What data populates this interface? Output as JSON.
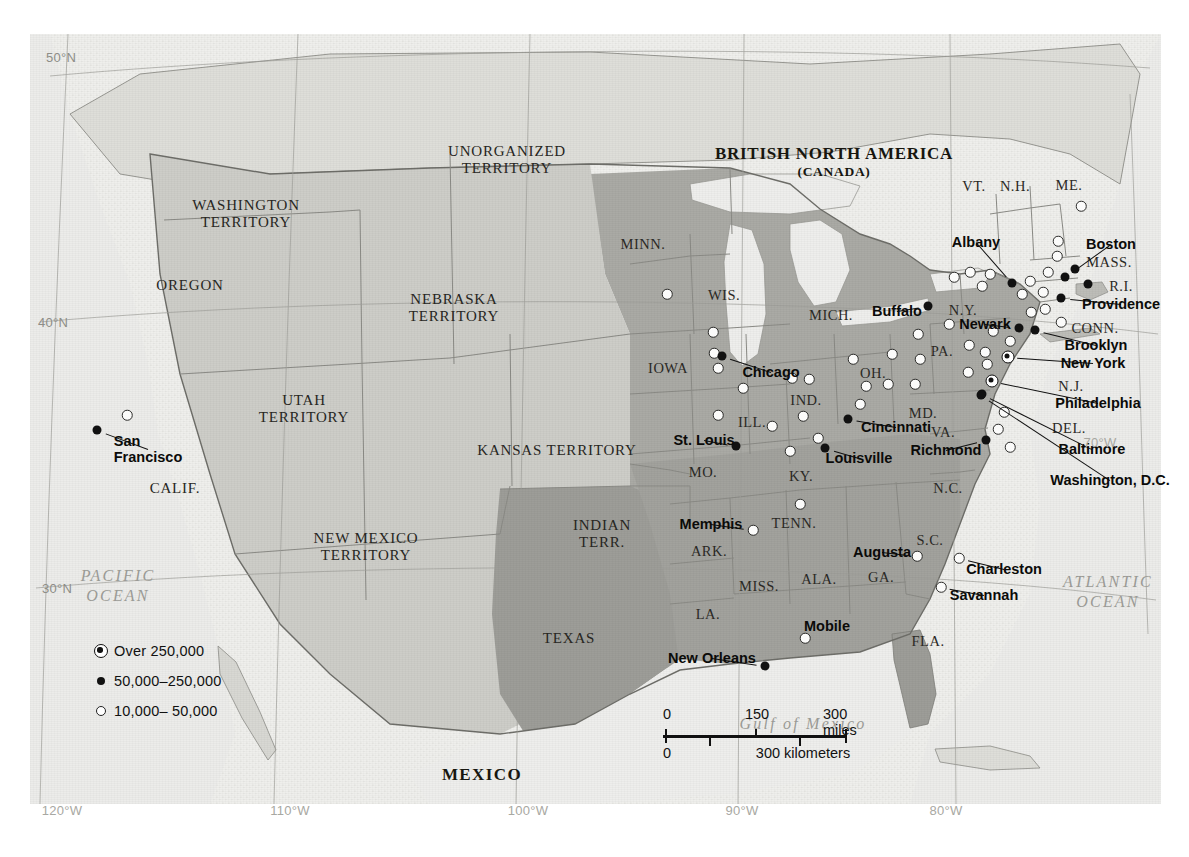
{
  "map": {
    "title": "United States in 1860 — Population Centers",
    "projection_note": "conic",
    "colors": {
      "union_fill": "#a9a9a4",
      "territory_fill": "#cbcbc6",
      "texas_fill": "#9b9b96",
      "water": "#e9e9e6",
      "plate_bg": "#efefec",
      "border": "#7d7d78",
      "ink": "#111111"
    }
  },
  "countries": [
    {
      "name": "BRITISH NORTH AMERICA",
      "sub": "(CANADA)",
      "x": 804,
      "y": 128
    },
    {
      "name": "MEXICO",
      "x": 452,
      "y": 741
    }
  ],
  "oceans": [
    {
      "name": "PACIFIC\nOCEAN",
      "line1": "PACIFIC",
      "line2": "OCEAN",
      "x": 88,
      "y": 552
    },
    {
      "name": "ATLANTIC\nOCEAN",
      "line1": "ATLANTIC",
      "line2": "OCEAN",
      "x": 1078,
      "y": 558
    },
    {
      "name": "Gulf of Mexico",
      "line1": "Gulf of Mexico",
      "line2": "",
      "x": 773,
      "y": 690
    }
  ],
  "territories": [
    {
      "label": "WASHINGTON\nTERRITORY",
      "l1": "WASHINGTON",
      "l2": "TERRITORY",
      "x": 216,
      "y": 180
    },
    {
      "label": "OREGON",
      "l1": "OREGON",
      "l2": "",
      "x": 160,
      "y": 252
    },
    {
      "label": "NEBRASKA\nTERRITORY",
      "l1": "NEBRASKA",
      "l2": "TERRITORY",
      "x": 424,
      "y": 274
    },
    {
      "label": "UTAH\nTERRITORY",
      "l1": "UTAH",
      "l2": "TERRITORY",
      "x": 274,
      "y": 375
    },
    {
      "label": "KANSAS TERRITORY",
      "l1": "KANSAS TERRITORY",
      "l2": "",
      "x": 527,
      "y": 417
    },
    {
      "label": "NEW MEXICO\nTERRITORY",
      "l1": "NEW MEXICO",
      "l2": "TERRITORY",
      "x": 336,
      "y": 513
    },
    {
      "label": "INDIAN\nTERR.",
      "l1": "INDIAN",
      "l2": "TERR.",
      "x": 572,
      "y": 500
    },
    {
      "label": "TEXAS",
      "l1": "TEXAS",
      "l2": "",
      "x": 539,
      "y": 605
    },
    {
      "label": "UNORGANIZED\nTERRITORY",
      "l1": "UNORGANIZED",
      "l2": "TERRITORY",
      "x": 477,
      "y": 126
    },
    {
      "label": "CALIF.",
      "l1": "CALIF.",
      "l2": "",
      "x": 145,
      "y": 455
    }
  ],
  "state_abbrs": [
    {
      "t": "MINN.",
      "x": 613,
      "y": 210
    },
    {
      "t": "WIS.",
      "x": 694,
      "y": 261
    },
    {
      "t": "MICH.",
      "x": 801,
      "y": 281
    },
    {
      "t": "IOWA",
      "x": 638,
      "y": 334
    },
    {
      "t": "ILL.",
      "x": 722,
      "y": 388
    },
    {
      "t": "IND.",
      "x": 776,
      "y": 366
    },
    {
      "t": "OH.",
      "x": 843,
      "y": 339
    },
    {
      "t": "MO.",
      "x": 673,
      "y": 438
    },
    {
      "t": "KY.",
      "x": 771,
      "y": 442
    },
    {
      "t": "TENN.",
      "x": 764,
      "y": 489
    },
    {
      "t": "ARK.",
      "x": 679,
      "y": 517
    },
    {
      "t": "MISS.",
      "x": 729,
      "y": 552
    },
    {
      "t": "ALA.",
      "x": 789,
      "y": 545
    },
    {
      "t": "GA.",
      "x": 851,
      "y": 543
    },
    {
      "t": "LA.",
      "x": 678,
      "y": 580
    },
    {
      "t": "FLA.",
      "x": 898,
      "y": 607
    },
    {
      "t": "S.C.",
      "x": 900,
      "y": 506
    },
    {
      "t": "N.C.",
      "x": 918,
      "y": 454
    },
    {
      "t": "VA.",
      "x": 913,
      "y": 398
    },
    {
      "t": "MD.",
      "x": 893,
      "y": 379
    },
    {
      "t": "PA.",
      "x": 912,
      "y": 317
    },
    {
      "t": "N.Y.",
      "x": 933,
      "y": 276
    },
    {
      "t": "N.J.",
      "x": 1041,
      "y": 352
    },
    {
      "t": "DEL.",
      "x": 1039,
      "y": 394
    },
    {
      "t": "CONN.",
      "x": 1065,
      "y": 294
    },
    {
      "t": "R.I.",
      "x": 1091,
      "y": 252
    },
    {
      "t": "MASS.",
      "x": 1079,
      "y": 228
    },
    {
      "t": "VT.",
      "x": 944,
      "y": 152
    },
    {
      "t": "N.H.",
      "x": 985,
      "y": 152
    },
    {
      "t": "ME.",
      "x": 1039,
      "y": 151
    }
  ],
  "cities": [
    {
      "name": "San Francisco",
      "l1": "San",
      "l2": "Francisco",
      "tier": "mid",
      "label_x": 118,
      "label_y": 415,
      "dot_x": 67,
      "dot_y": 396
    },
    {
      "name": "Chicago",
      "l1": "Chicago",
      "l2": "",
      "tier": "mid",
      "label_x": 741,
      "label_y": 338,
      "dot_x": 692,
      "dot_y": 322
    },
    {
      "name": "St. Louis",
      "l1": "St. Louis",
      "l2": "",
      "tier": "mid",
      "label_x": 674,
      "label_y": 406,
      "dot_x": 706,
      "dot_y": 412
    },
    {
      "name": "Cincinnati",
      "l1": "Cincinnati",
      "l2": "",
      "tier": "mid",
      "label_x": 866,
      "label_y": 393,
      "dot_x": 818,
      "dot_y": 385
    },
    {
      "name": "Louisville",
      "l1": "Louisville",
      "l2": "",
      "tier": "mid",
      "label_x": 829,
      "label_y": 424,
      "dot_x": 795,
      "dot_y": 414
    },
    {
      "name": "Buffalo",
      "l1": "Buffalo",
      "l2": "",
      "tier": "mid",
      "label_x": 867,
      "label_y": 277,
      "dot_x": 898,
      "dot_y": 272
    },
    {
      "name": "Albany",
      "l1": "Albany",
      "l2": "",
      "tier": "mid",
      "label_x": 946,
      "label_y": 208,
      "dot_x": 982,
      "dot_y": 249
    },
    {
      "name": "Boston",
      "l1": "Boston",
      "l2": "",
      "tier": "mid",
      "label_x": 1081,
      "label_y": 210,
      "dot_x": 1035,
      "dot_y": 243
    },
    {
      "name": "Providence",
      "l1": "Providence",
      "l2": "",
      "tier": "mid",
      "label_x": 1091,
      "label_y": 270,
      "dot_x": 1031,
      "dot_y": 264
    },
    {
      "name": "Newark",
      "l1": "Newark",
      "l2": "",
      "tier": "mid",
      "label_x": 955,
      "label_y": 290,
      "dot_x": 989,
      "dot_y": 294
    },
    {
      "name": "Brooklyn",
      "l1": "Brooklyn",
      "l2": "",
      "tier": "mid",
      "label_x": 1066,
      "label_y": 311,
      "dot_x": 1005,
      "dot_y": 296
    },
    {
      "name": "New York",
      "l1": "New York",
      "l2": "",
      "tier": "over",
      "label_x": 1063,
      "label_y": 329,
      "dot_x": 978,
      "dot_y": 323
    },
    {
      "name": "Philadelphia",
      "l1": "Philadelphia",
      "l2": "",
      "tier": "over",
      "label_x": 1068,
      "label_y": 369,
      "dot_x": 962,
      "dot_y": 347
    },
    {
      "name": "Baltimore",
      "l1": "Baltimore",
      "l2": "",
      "tier": "mid",
      "label_x": 1062,
      "label_y": 415,
      "dot_x": 952,
      "dot_y": 360
    },
    {
      "name": "Washington, D.C.",
      "l1": "Washington, D.C.",
      "l2": "",
      "tier": "mid",
      "label_x": 1080,
      "label_y": 446,
      "dot_x": 951,
      "dot_y": 361
    },
    {
      "name": "Richmond",
      "l1": "Richmond",
      "l2": "",
      "tier": "mid",
      "label_x": 916,
      "label_y": 416,
      "dot_x": 956,
      "dot_y": 406
    },
    {
      "name": "Memphis",
      "l1": "Memphis",
      "l2": "",
      "tier": "small",
      "label_x": 681,
      "label_y": 490,
      "dot_x": 723,
      "dot_y": 496
    },
    {
      "name": "Augusta",
      "l1": "Augusta",
      "l2": "",
      "tier": "small",
      "label_x": 852,
      "label_y": 518,
      "dot_x": 887,
      "dot_y": 522
    },
    {
      "name": "Charleston",
      "l1": "Charleston",
      "l2": "",
      "tier": "small",
      "label_x": 974,
      "label_y": 535,
      "dot_x": 929,
      "dot_y": 524
    },
    {
      "name": "Savannah",
      "l1": "Savannah",
      "l2": "",
      "tier": "small",
      "label_x": 954,
      "label_y": 561,
      "dot_x": 911,
      "dot_y": 553
    },
    {
      "name": "Mobile",
      "l1": "Mobile",
      "l2": "",
      "tier": "small",
      "label_x": 797,
      "label_y": 592,
      "dot_x": 775,
      "dot_y": 604
    },
    {
      "name": "New Orleans",
      "l1": "New Orleans",
      "l2": "",
      "tier": "mid",
      "label_x": 682,
      "label_y": 624,
      "dot_x": 735,
      "dot_y": 632
    }
  ],
  "unlabeled_dots": [
    {
      "tier": "small",
      "x": 97,
      "y": 381
    },
    {
      "tier": "small",
      "x": 637,
      "y": 260
    },
    {
      "tier": "small",
      "x": 683,
      "y": 298
    },
    {
      "tier": "small",
      "x": 684,
      "y": 319
    },
    {
      "tier": "small",
      "x": 688,
      "y": 334
    },
    {
      "tier": "small",
      "x": 713,
      "y": 354
    },
    {
      "tier": "small",
      "x": 688,
      "y": 381
    },
    {
      "tier": "small",
      "x": 742,
      "y": 392
    },
    {
      "tier": "small",
      "x": 762,
      "y": 344
    },
    {
      "tier": "small",
      "x": 779,
      "y": 345
    },
    {
      "tier": "small",
      "x": 773,
      "y": 382
    },
    {
      "tier": "small",
      "x": 788,
      "y": 404
    },
    {
      "tier": "small",
      "x": 760,
      "y": 417
    },
    {
      "tier": "small",
      "x": 770,
      "y": 470
    },
    {
      "tier": "small",
      "x": 823,
      "y": 325
    },
    {
      "tier": "small",
      "x": 836,
      "y": 352
    },
    {
      "tier": "small",
      "x": 830,
      "y": 370
    },
    {
      "tier": "small",
      "x": 858,
      "y": 350
    },
    {
      "tier": "small",
      "x": 862,
      "y": 320
    },
    {
      "tier": "small",
      "x": 885,
      "y": 350
    },
    {
      "tier": "small",
      "x": 890,
      "y": 325
    },
    {
      "tier": "small",
      "x": 888,
      "y": 300
    },
    {
      "tier": "small",
      "x": 919,
      "y": 290
    },
    {
      "tier": "small",
      "x": 924,
      "y": 243
    },
    {
      "tier": "small",
      "x": 940,
      "y": 238
    },
    {
      "tier": "small",
      "x": 952,
      "y": 252
    },
    {
      "tier": "small",
      "x": 939,
      "y": 311
    },
    {
      "tier": "small",
      "x": 955,
      "y": 318
    },
    {
      "tier": "small",
      "x": 957,
      "y": 330
    },
    {
      "tier": "small",
      "x": 938,
      "y": 338
    },
    {
      "tier": "small",
      "x": 963,
      "y": 297
    },
    {
      "tier": "small",
      "x": 980,
      "y": 307
    },
    {
      "tier": "small",
      "x": 992,
      "y": 260
    },
    {
      "tier": "small",
      "x": 1000,
      "y": 247
    },
    {
      "tier": "small",
      "x": 1018,
      "y": 238
    },
    {
      "tier": "small",
      "x": 1013,
      "y": 258
    },
    {
      "tier": "small",
      "x": 1027,
      "y": 222
    },
    {
      "tier": "small",
      "x": 1015,
      "y": 275
    },
    {
      "tier": "small",
      "x": 1031,
      "y": 288
    },
    {
      "tier": "small",
      "x": 1001,
      "y": 278
    },
    {
      "tier": "small",
      "x": 1028,
      "y": 207
    },
    {
      "tier": "small",
      "x": 1051,
      "y": 172
    },
    {
      "tier": "small",
      "x": 960,
      "y": 240
    },
    {
      "tier": "small",
      "x": 974,
      "y": 378
    },
    {
      "tier": "small",
      "x": 968,
      "y": 395
    },
    {
      "tier": "small",
      "x": 980,
      "y": 413
    },
    {
      "tier": "mid",
      "x": 1045,
      "y": 235
    },
    {
      "tier": "mid",
      "x": 1058,
      "y": 250
    }
  ],
  "legend": {
    "items": [
      {
        "symbol": "over",
        "label": "Over 250,000"
      },
      {
        "symbol": "mid",
        "label": "50,000–250,000"
      },
      {
        "symbol": "small",
        "label": "10,000– 50,000"
      }
    ]
  },
  "scale_bar": {
    "miles": {
      "ticks": [
        "0",
        "150",
        "300 miles"
      ]
    },
    "kilometers": {
      "ticks": [
        "0",
        "300 kilometers"
      ]
    }
  },
  "graticule": {
    "latitudes": [
      {
        "t": "50°N",
        "x": 61,
        "y": 57
      },
      {
        "t": "40°N",
        "x": 53,
        "y": 322
      },
      {
        "t": "30°N",
        "x": 57,
        "y": 588
      }
    ],
    "longitudes": [
      {
        "t": "120°W",
        "x": 62,
        "y": 810
      },
      {
        "t": "110°W",
        "x": 290,
        "y": 810
      },
      {
        "t": "100°W",
        "x": 528,
        "y": 810
      },
      {
        "t": "90°W",
        "x": 742,
        "y": 810
      },
      {
        "t": "80°W",
        "x": 946,
        "y": 810
      },
      {
        "t": "70°W",
        "x": 1100,
        "y": 442
      }
    ]
  }
}
